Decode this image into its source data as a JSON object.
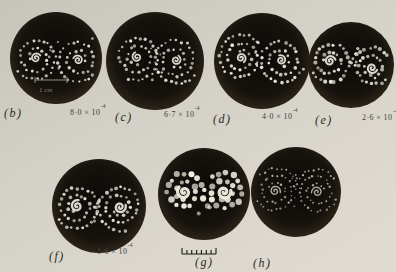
{
  "figure": {
    "colors": {
      "page_bg": "#d3d0c7",
      "photo_center": "#0c0a08",
      "photo_mid": "#16120d",
      "photo_rim": "#292217",
      "dot": "#e7e4d8",
      "dot_bright": "#f1eee2",
      "dot_dim": "#b7b3a6",
      "ink": "#1d1a14",
      "scale_bar": "#968f82",
      "scale_text": "#8a8478",
      "panel_label": "#2b2820",
      "value_label": "#45413a"
    },
    "scale_bar": {
      "label": "1 cm",
      "x1": 35,
      "x2": 67,
      "y": 80,
      "text_x": 39,
      "text_y": 84
    },
    "ruler": {
      "x": 182,
      "y": 254,
      "width": 34,
      "ticks": 8,
      "tick_h": 4,
      "end_tick_h": 6
    },
    "panels": [
      {
        "id": "b",
        "label": "(b)",
        "value_base": "8·0 × 10",
        "value_exp": "-4",
        "photo": {
          "cx": 56,
          "cy": 58,
          "r": 46
        },
        "label_pos": {
          "x": 4,
          "y": 106
        },
        "value_pos": {
          "x": 70,
          "y": 106
        },
        "pattern": {
          "seed": 11,
          "dot_r": 1.4,
          "ds": 5.2,
          "core_w": 1.7,
          "core_r": 5,
          "mid_dots": 4,
          "style": "normal",
          "clusters": [
            {
              "dx": -20,
              "dy": 0,
              "rmax": 24,
              "turns": 2.1,
              "dir": 1,
              "phi0": 2.0
            },
            {
              "dx": 22,
              "dy": 2,
              "rmax": 25,
              "turns": 2.2,
              "dir": -1,
              "phi0": 1.0
            }
          ]
        },
        "has_scale_bar": true
      },
      {
        "id": "c",
        "label": "(c)",
        "value_base": "6·7 × 10",
        "value_exp": "-4",
        "photo": {
          "cx": 155,
          "cy": 61,
          "r": 49
        },
        "label_pos": {
          "x": 115,
          "y": 110
        },
        "value_pos": {
          "x": 164,
          "y": 108
        },
        "pattern": {
          "seed": 23,
          "dot_r": 1.4,
          "ds": 5.2,
          "core_w": 1.7,
          "core_r": 5,
          "mid_dots": 4,
          "style": "normal",
          "clusters": [
            {
              "dx": -18,
              "dy": -4,
              "rmax": 24,
              "turns": 2.1,
              "dir": 1,
              "phi0": 0.6
            },
            {
              "dx": 21,
              "dy": -1,
              "rmax": 25,
              "turns": 2.2,
              "dir": -1,
              "phi0": 2.7
            }
          ]
        },
        "has_scale_bar": false
      },
      {
        "id": "d",
        "label": "(d)",
        "value_base": "4·0 × 10",
        "value_exp": "-4",
        "photo": {
          "cx": 262,
          "cy": 61,
          "r": 48
        },
        "label_pos": {
          "x": 213,
          "y": 112
        },
        "value_pos": {
          "x": 262,
          "y": 110
        },
        "pattern": {
          "seed": 37,
          "dot_r": 1.5,
          "ds": 5.2,
          "core_w": 1.8,
          "core_r": 5,
          "mid_dots": 5,
          "style": "normal",
          "clusters": [
            {
              "dx": -21,
              "dy": -3,
              "rmax": 24,
              "turns": 2.2,
              "dir": 1,
              "phi0": 3.5
            },
            {
              "dx": 19,
              "dy": -1,
              "rmax": 24,
              "turns": 2.1,
              "dir": -1,
              "phi0": 1.8
            }
          ]
        },
        "has_scale_bar": false
      },
      {
        "id": "e",
        "label": "(e)",
        "value_base": "2·6 × 10",
        "value_exp": "-4",
        "photo": {
          "cx": 351,
          "cy": 65,
          "r": 43
        },
        "label_pos": {
          "x": 315,
          "y": 113
        },
        "value_pos": {
          "x": 362,
          "y": 111
        },
        "pattern": {
          "seed": 51,
          "dot_r": 1.7,
          "ds": 5.0,
          "core_w": 2.0,
          "core_r": 5.5,
          "mid_dots": 4,
          "style": "normal",
          "clusters": [
            {
              "dx": -21,
              "dy": -4,
              "rmax": 23,
              "turns": 2.0,
              "dir": 1,
              "phi0": 2.3
            },
            {
              "dx": 21,
              "dy": 3,
              "rmax": 22,
              "turns": 2.0,
              "dir": -1,
              "phi0": 4.1
            }
          ]
        },
        "has_scale_bar": false
      },
      {
        "id": "f",
        "label": "(f)",
        "value_base": "1·6 × 10",
        "value_exp": "-4",
        "photo": {
          "cx": 99,
          "cy": 206,
          "r": 47
        },
        "label_pos": {
          "x": 49,
          "y": 249
        },
        "value_pos": {
          "x": 97,
          "y": 245
        },
        "pattern": {
          "seed": 67,
          "dot_r": 1.6,
          "ds": 5.2,
          "core_w": 2.3,
          "core_r": 6,
          "mid_dots": 3,
          "style": "normal",
          "clusters": [
            {
              "dx": -22,
              "dy": 0,
              "rmax": 25,
              "turns": 2.3,
              "dir": 1,
              "phi0": 1.2
            },
            {
              "dx": 21,
              "dy": 1,
              "rmax": 24,
              "turns": 2.2,
              "dir": -1,
              "phi0": 3.4
            }
          ]
        },
        "has_scale_bar": false
      },
      {
        "id": "g",
        "label": "(g)",
        "value_base": "",
        "value_exp": "",
        "photo": {
          "cx": 204,
          "cy": 194,
          "r": 46
        },
        "label_pos": {
          "x": 195,
          "y": 255
        },
        "value_pos": {
          "x": 0,
          "y": 0
        },
        "pattern": {
          "seed": 83,
          "dot_r": 2.6,
          "ds": 7.2,
          "core_w": 3.2,
          "core_r": 7,
          "mid_dots": 3,
          "style": "blurred",
          "clusters": [
            {
              "dx": -20,
              "dy": -2,
              "rmax": 21,
              "turns": 1.8,
              "dir": 1,
              "phi0": 0.8
            },
            {
              "dx": 20,
              "dy": -2,
              "rmax": 20,
              "turns": 1.7,
              "dir": -1,
              "phi0": 2.9
            }
          ]
        },
        "has_scale_bar": false
      },
      {
        "id": "h",
        "label": "(h)",
        "value_base": "",
        "value_exp": "",
        "photo": {
          "cx": 296,
          "cy": 192,
          "r": 45
        },
        "label_pos": {
          "x": 253,
          "y": 256
        },
        "value_pos": {
          "x": 0,
          "y": 0
        },
        "pattern": {
          "seed": 95,
          "dot_r": 1.0,
          "ds": 4.5,
          "core_w": 1.4,
          "core_r": 5.5,
          "mid_dots": 6,
          "style": "dim",
          "clusters": [
            {
              "dx": -21,
              "dy": -1,
              "rmax": 24,
              "turns": 2.4,
              "dir": 1,
              "phi0": 2.8
            },
            {
              "dx": 21,
              "dy": 0,
              "rmax": 24,
              "turns": 2.4,
              "dir": -1,
              "phi0": 0.5
            }
          ]
        },
        "has_scale_bar": false
      }
    ]
  }
}
